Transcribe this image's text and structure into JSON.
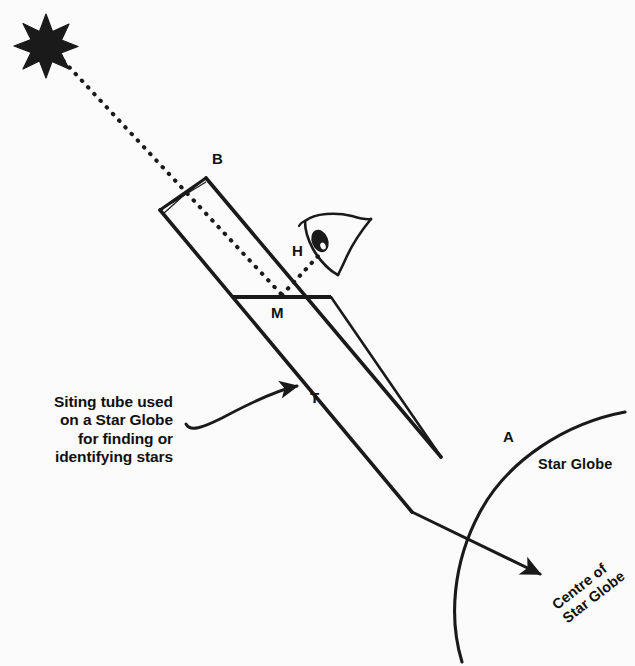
{
  "figure": {
    "background_color": "#fbfbfb",
    "ink_color": "#1a1a1a"
  },
  "labels": {
    "point_b": "B",
    "point_h": "H",
    "point_m": "M",
    "point_t": "T",
    "point_a": "A",
    "star_globe": "Star Globe",
    "centre_of_star_globe_line1": "Centre of",
    "centre_of_star_globe_line2": "Star Globe"
  },
  "caption": {
    "line1": "Siting tube used",
    "line2": "on a Star Globe",
    "line3": "for finding or",
    "line4": "identifying stars"
  },
  "icons": {
    "star": "star-icon",
    "eye": "eye-icon",
    "caption_arrow": "curved-arrow-icon",
    "centre_arrow": "straight-arrow-icon",
    "light_ray": "dotted-ray-icon"
  },
  "geometry": {
    "star_center": [
      46,
      42
    ],
    "tube_top_corner": [
      206,
      178
    ],
    "tube_left_corner": [
      160,
      210
    ],
    "crosshair_center": [
      183,
      196
    ],
    "mirror_left": [
      233,
      297
    ],
    "mirror_right": [
      331,
      297
    ],
    "globe_arc_start": [
      625,
      412
    ],
    "globe_arc_end": [
      462,
      662
    ],
    "centre_arrow_tip": [
      546,
      579
    ],
    "caption_arrow_tip": [
      303,
      385
    ]
  }
}
